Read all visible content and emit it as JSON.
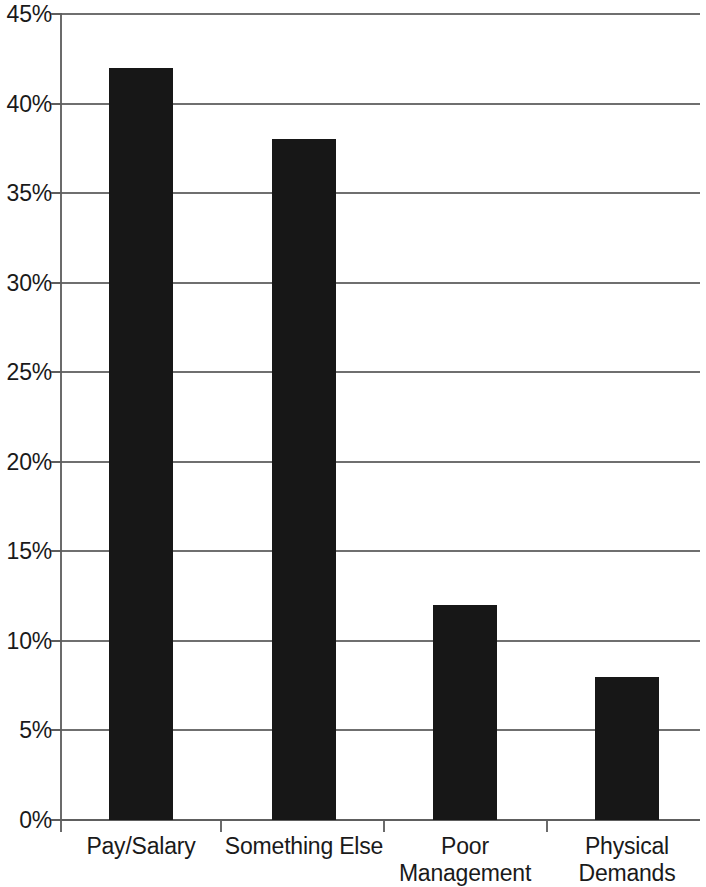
{
  "chart_data": {
    "type": "bar",
    "title": "",
    "subtitle": "",
    "xlabel": "",
    "ylabel": "",
    "categories": [
      "Pay/Salary",
      "Something Else",
      "Poor\nManagement",
      "Physical\nDemands"
    ],
    "values": [
      42,
      38,
      12,
      8
    ],
    "value_labels": [
      "42%",
      "38%",
      "12%",
      "8%"
    ],
    "ylim": [
      0,
      45
    ],
    "ytick_values": [
      0,
      5,
      10,
      15,
      20,
      25,
      30,
      35,
      40,
      45
    ],
    "ytick_labels": [
      "0%",
      "5%",
      "10%",
      "15%",
      "20%",
      "25%",
      "30%",
      "35%",
      "40%",
      "45%"
    ],
    "grid": true,
    "grid_axis": "y",
    "legend": false,
    "legend_position": "none",
    "bar_color": "#171717",
    "gridline_color": "#6f6f6f",
    "axis_color": "#6b6b6b",
    "background_color": "#ffffff"
  }
}
